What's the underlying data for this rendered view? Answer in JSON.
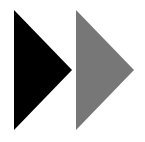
{
  "icon": {
    "name": "fast-forward-icon",
    "colors": {
      "background": "#ffffff",
      "first_triangle": "#000000",
      "second_triangle": "#777777"
    }
  }
}
